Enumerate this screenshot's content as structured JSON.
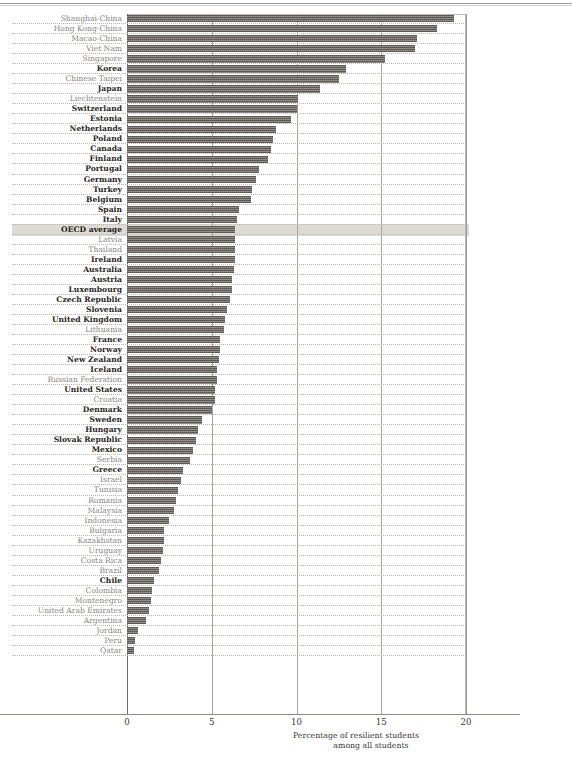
{
  "chart_data": {
    "type": "bar",
    "orientation": "horizontal",
    "title": "",
    "xlabel": "Percentage of resilient students among all students",
    "ylabel": "",
    "xlim": [
      0,
      20
    ],
    "xticks": [
      "0",
      "5",
      "10",
      "15",
      "20"
    ],
    "grid": true,
    "legend": "none",
    "highlight_row": "OECD average",
    "bar_color": "#5d5954",
    "oecd_label_color": "#2b2724",
    "partner_label_color": "#8a8580",
    "highlight_band_color": "#dedbd7",
    "categories": [
      "Shanghai-China",
      "Hong Kong-China",
      "Macao-China",
      "Viet Nam",
      "Singapore",
      "Korea",
      "Chinese Taipei",
      "Japan",
      "Liechtenstein",
      "Switzerland",
      "Estonia",
      "Netherlands",
      "Poland",
      "Canada",
      "Finland",
      "Portugal",
      "Germany",
      "Turkey",
      "Belgium",
      "Spain",
      "Italy",
      "OECD average",
      "Latvia",
      "Thailand",
      "Ireland",
      "Australia",
      "Austria",
      "Luxembourg",
      "Czech Republic",
      "Slovenia",
      "United Kingdom",
      "Lithuania",
      "France",
      "Norway",
      "New Zealand",
      "Iceland",
      "Russian Federation",
      "United States",
      "Croatia",
      "Denmark",
      "Sweden",
      "Hungary",
      "Slovak Republic",
      "Mexico",
      "Serbia",
      "Greece",
      "Israel",
      "Tunisia",
      "Romania",
      "Malaysia",
      "Indonesia",
      "Bulgaria",
      "Kazakhstan",
      "Uruguay",
      "Costa Rica",
      "Brazil",
      "Chile",
      "Colombia",
      "Montenegro",
      "United Arab Emirates",
      "Argentina",
      "Jordan",
      "Peru",
      "Qatar"
    ],
    "values": [
      19.3,
      18.3,
      17.1,
      17.0,
      15.2,
      12.9,
      12.5,
      11.4,
      10.1,
      10.0,
      9.7,
      8.8,
      8.6,
      8.5,
      8.3,
      7.8,
      7.6,
      7.4,
      7.3,
      6.6,
      6.5,
      6.4,
      6.4,
      6.4,
      6.4,
      6.3,
      6.2,
      6.2,
      6.1,
      5.9,
      5.8,
      5.7,
      5.5,
      5.5,
      5.4,
      5.3,
      5.3,
      5.2,
      5.2,
      5.0,
      4.4,
      4.2,
      4.1,
      3.9,
      3.7,
      3.3,
      3.2,
      3.0,
      2.9,
      2.8,
      2.5,
      2.2,
      2.2,
      2.1,
      2.0,
      1.9,
      1.6,
      1.5,
      1.4,
      1.3,
      1.1,
      0.65,
      0.45,
      0.4
    ],
    "label_styles": [
      "partner",
      "partner",
      "partner",
      "partner",
      "partner",
      "oecd",
      "partner",
      "oecd",
      "partner",
      "oecd",
      "oecd",
      "oecd",
      "oecd",
      "oecd",
      "oecd",
      "oecd",
      "oecd",
      "oecd",
      "oecd",
      "oecd",
      "oecd",
      "average",
      "partner",
      "partner",
      "oecd",
      "oecd",
      "oecd",
      "oecd",
      "oecd",
      "oecd",
      "oecd",
      "partner",
      "oecd",
      "oecd",
      "oecd",
      "oecd",
      "partner",
      "oecd",
      "partner",
      "oecd",
      "oecd",
      "oecd",
      "oecd",
      "oecd",
      "partner",
      "oecd",
      "partner",
      "partner",
      "partner",
      "partner",
      "partner",
      "partner",
      "partner",
      "partner",
      "partner",
      "partner",
      "oecd",
      "partner",
      "partner",
      "partner",
      "partner",
      "partner",
      "partner",
      "partner"
    ]
  },
  "axis": {
    "title_line1": "Percentage of resilient students",
    "title_line2": "among all students"
  },
  "footer": {
    "cut_off_caption": ""
  }
}
